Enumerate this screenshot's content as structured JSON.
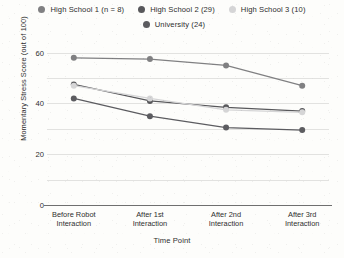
{
  "legend": {
    "rows": [
      [
        {
          "label": "High School 1 (n = 8)",
          "color": "#808082",
          "key": "hs1"
        },
        {
          "label": "High School 2 (29)",
          "color": "#58585b",
          "key": "hs2"
        },
        {
          "label": "High School 3 (10)",
          "color": "#d5d5d6",
          "key": "hs3"
        }
      ],
      [
        {
          "label": "University  (24)",
          "color": "#5c5c60",
          "key": "uni"
        }
      ]
    ]
  },
  "chart_data": {
    "type": "line",
    "title": "",
    "xlabel": "Time Point",
    "ylabel": "Momentary Stress Score (out of 100)",
    "categories": [
      "Before Robot Interaction",
      "After 1st Interaction",
      "After 2nd Interaction",
      "After 3rd Interaction"
    ],
    "category_lines": [
      [
        "Before Robot",
        "Interaction"
      ],
      [
        "After 1st",
        "Interaction"
      ],
      [
        "After 2nd",
        "Interaction"
      ],
      [
        "After 3rd",
        "Interaction"
      ]
    ],
    "ylim": [
      0,
      65
    ],
    "yticks": [
      0,
      20,
      40,
      60
    ],
    "ytick_labels": [
      "0",
      "20",
      "40",
      "60"
    ],
    "gridlines": [
      0,
      10,
      20,
      30,
      40,
      50,
      60
    ],
    "grid": true,
    "legend_position": "top",
    "series": [
      {
        "name": "High School 1 (n = 8)",
        "color": "#808082",
        "values": [
          58.0,
          57.5,
          55.0,
          47.0
        ]
      },
      {
        "name": "High School 2 (29)",
        "color": "#58585b",
        "values": [
          47.5,
          41.0,
          38.5,
          37.0
        ]
      },
      {
        "name": "High School 3 (10)",
        "color": "#d5d5d6",
        "values": [
          47.0,
          42.0,
          37.5,
          36.5
        ]
      },
      {
        "name": "University  (24)",
        "color": "#5c5c60",
        "values": [
          42.0,
          35.0,
          30.5,
          29.5
        ]
      }
    ]
  }
}
